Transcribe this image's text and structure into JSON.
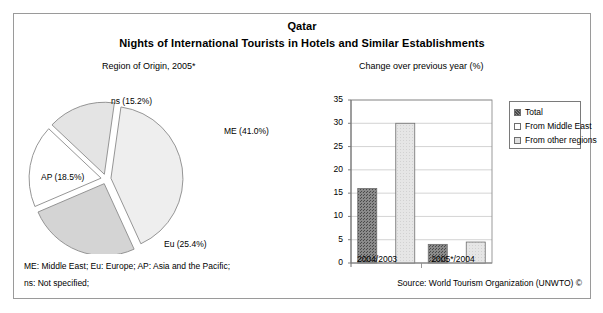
{
  "figure": {
    "country_title": "Qatar",
    "main_title": "Nights of International Tourists in Hotels and Similar Establishments",
    "pie_caption": "Region of Origin, 2005*",
    "bar_caption": "Change over previous year (%)"
  },
  "footer": {
    "abbrev_line_1": "ME: Middle East; Eu: Europe; AP: Asia and the Pacific;",
    "abbrev_line_2": "ns: Not specified;",
    "source": "Source: World Tourism Organization (UNWTO) ©"
  },
  "colors": {
    "me_slice": "#eeeeee",
    "eu_slice": "#d4d4d4",
    "ap_slice": "#ffffff",
    "ns_slice": "#e4e4e4",
    "total_bar": "#7d7d7d",
    "middle_east_bar": "#ffffff",
    "other_regions_bar": "#e0e0e0",
    "outline": "#8a8a8a",
    "frame": "#9a9a9a",
    "gridline": "#c8c8c8"
  },
  "chart_data": [
    {
      "type": "pie",
      "title": "Region of Origin, 2005*",
      "categories": [
        "ME",
        "Eu",
        "AP",
        "ns"
      ],
      "values": [
        41.0,
        25.4,
        18.5,
        15.2
      ],
      "labels": [
        "ME (41.0%)",
        "Eu (25.4%)",
        "AP (18.5%)",
        "ns (15.2%)"
      ],
      "unit": "%",
      "exploded": true,
      "legend": "none"
    },
    {
      "type": "bar",
      "title": "Change over previous year (%)",
      "categories": [
        "2004/2003",
        "2005*/2004"
      ],
      "series": [
        {
          "name": "Total",
          "values": [
            16.0,
            4.0
          ]
        },
        {
          "name": "From Middle East",
          "values": [
            0.0,
            0.0
          ]
        },
        {
          "name": "From other regions",
          "values": [
            30.0,
            4.5
          ]
        }
      ],
      "xlabel": "",
      "ylabel": "",
      "ylim": [
        0,
        35
      ],
      "yticks": [
        0,
        5,
        10,
        15,
        20,
        25,
        30,
        35
      ],
      "ytick_labels": [
        "0",
        "5",
        "10",
        "15",
        "20",
        "25",
        "30",
        "35"
      ],
      "grid": true,
      "legend_position": "right"
    }
  ],
  "legend": {
    "items": [
      {
        "label": "Total",
        "swatch": "#7d7d7d"
      },
      {
        "label": "From Middle East",
        "swatch": "#ffffff"
      },
      {
        "label": "From other regions",
        "swatch": "#e0e0e0"
      }
    ]
  }
}
